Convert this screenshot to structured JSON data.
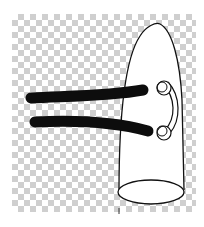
{
  "illustration": {
    "subject": "cone-with-two-rods",
    "background": "transparency-checkerboard",
    "colors": {
      "outline": "#111111",
      "rod": "#0d0d0d",
      "cone_fill": "#ffffff",
      "checker_dark": "#cfcfcf",
      "checker_light": "#ffffff"
    },
    "parts": [
      "cone",
      "cone-base-ellipse",
      "upper-rod",
      "lower-rod",
      "upper-ring",
      "lower-ring",
      "connecting-bracket"
    ]
  }
}
